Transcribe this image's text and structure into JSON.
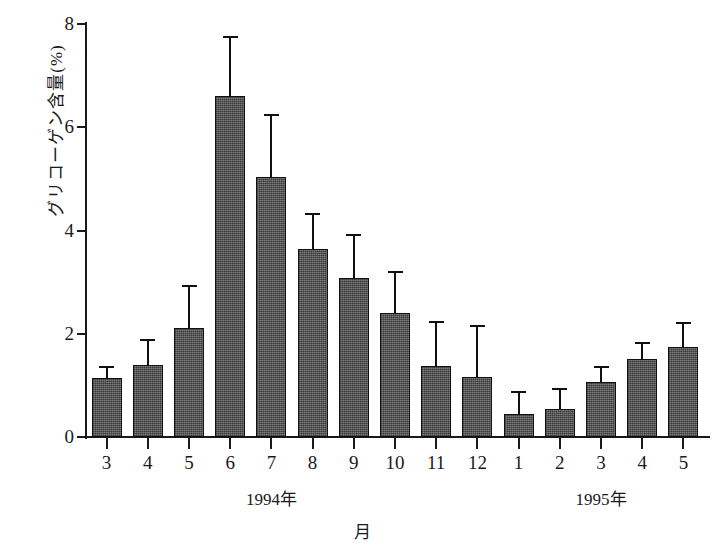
{
  "chart_data": {
    "type": "bar",
    "title": "",
    "xlabel": "月",
    "ylabel": "グリコーゲン含量(%)",
    "ylim": [
      0,
      8
    ],
    "yticks": [
      0,
      2,
      4,
      6,
      8
    ],
    "ytick_labels": [
      "0",
      "2",
      "4",
      "6",
      "8"
    ],
    "grid": false,
    "legend": null,
    "categories": [
      "3",
      "4",
      "5",
      "6",
      "7",
      "8",
      "9",
      "10",
      "11",
      "12",
      "1",
      "2",
      "3",
      "4",
      "5"
    ],
    "values": [
      1.15,
      1.4,
      2.12,
      6.6,
      5.03,
      3.65,
      3.08,
      2.41,
      1.38,
      1.16,
      0.44,
      0.54,
      1.06,
      1.52,
      1.75
    ],
    "errors_upper": [
      1.35,
      1.87,
      2.93,
      7.74,
      6.23,
      4.32,
      3.92,
      3.2,
      2.22,
      2.15,
      0.88,
      0.93,
      1.35,
      1.82,
      2.2
    ],
    "error_kind": "upper-only",
    "series": [
      {
        "name": "グリコーゲン含量",
        "values": [
          1.15,
          1.4,
          2.12,
          6.6,
          5.03,
          3.65,
          3.08,
          2.41,
          1.38,
          1.16,
          0.44,
          0.54,
          1.06,
          1.52,
          1.75
        ]
      }
    ],
    "group_labels": [
      {
        "label": "1994年",
        "center_category_index": 4
      },
      {
        "label": "1995年",
        "center_category_index": 12
      }
    ],
    "bar_color": "#5e5e5e",
    "bar_edge_color": "#111111",
    "axis_color": "#1a1a1a",
    "background_color": "#ffffff"
  }
}
